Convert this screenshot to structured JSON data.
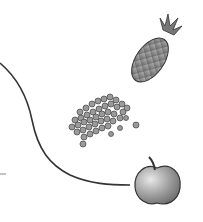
{
  "scene": {
    "description": "Grayscale illustration of food items connected by a curved line",
    "background": "#ffffff",
    "line_color": "#333333",
    "items": [
      {
        "name": "pineapple",
        "cx": 155,
        "cy": 55
      },
      {
        "name": "peas",
        "cx": 100,
        "cy": 118
      },
      {
        "name": "apple",
        "cx": 157,
        "cy": 183
      }
    ]
  }
}
